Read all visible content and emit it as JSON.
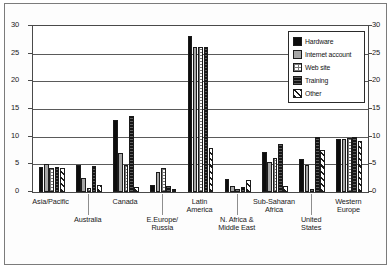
{
  "chart_data": {
    "type": "bar",
    "title": "",
    "xlabel": "",
    "ylabel": "",
    "ylim": [
      0,
      30
    ],
    "yticks": [
      0,
      5,
      10,
      15,
      20,
      25,
      30
    ],
    "ytick_labels": [
      "0",
      "5",
      "10",
      "15",
      "20",
      "25",
      "30"
    ],
    "grid": true,
    "legend_position": "top-right",
    "dual_y_axis": true,
    "categories": [
      "Asia/Pacific",
      "Australia",
      "Canada",
      "E.Europe/\nRussia",
      "Latin\nAmerica",
      "N. Africa &\nMiddle East",
      "Sub-Saharan\nAfrica",
      "United\nStates",
      "Western\nEurope"
    ],
    "series": [
      {
        "name": "Hardware",
        "color": "#0d0d0d",
        "values": [
          4.6,
          4.8,
          13.0,
          1.2,
          28.2,
          2.4,
          7.3,
          6.0,
          9.6
        ]
      },
      {
        "name": "Internet account",
        "color": "#a6a6a6",
        "values": [
          5.1,
          2.6,
          7.0,
          3.6,
          26.2,
          1.0,
          5.4,
          4.8,
          9.6
        ]
      },
      {
        "name": "Web site",
        "color": "#ffffff",
        "values": [
          4.4,
          0.8,
          4.9,
          4.4,
          26.2,
          0.5,
          6.2,
          0.6,
          9.8
        ]
      },
      {
        "name": "Training",
        "color": "#151515",
        "values": [
          4.6,
          4.7,
          13.7,
          1.0,
          26.2,
          0.9,
          8.6,
          10.0,
          10.0
        ]
      },
      {
        "name": "Other",
        "color": "#ffffff",
        "values": [
          4.3,
          1.3,
          0.9,
          0.6,
          8.0,
          2.1,
          1.1,
          7.6,
          9.3
        ]
      }
    ]
  },
  "legend": {
    "items": [
      {
        "label": "Hardware",
        "swatch": "swatch-hardware"
      },
      {
        "label": "Internet account",
        "swatch": "swatch-internet-account"
      },
      {
        "label": "Web site",
        "swatch": "swatch-web-site"
      },
      {
        "label": "Training",
        "swatch": "swatch-training"
      },
      {
        "label": "Other",
        "swatch": "swatch-other"
      }
    ]
  }
}
